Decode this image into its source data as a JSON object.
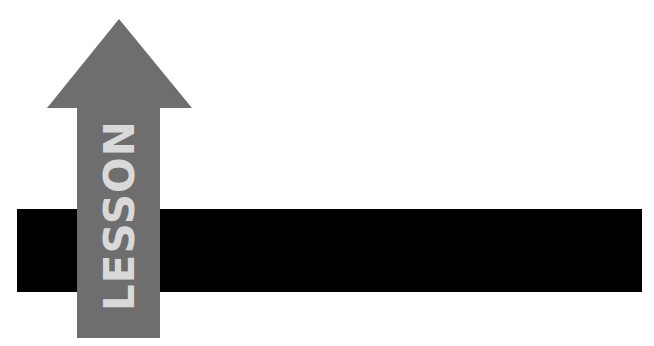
{
  "graphic": {
    "arrow_label": "LESSON",
    "colors": {
      "background": "#ffffff",
      "bar": "#000000",
      "arrow": "#6e6e6e",
      "label_text": "#d9d9d9"
    }
  }
}
